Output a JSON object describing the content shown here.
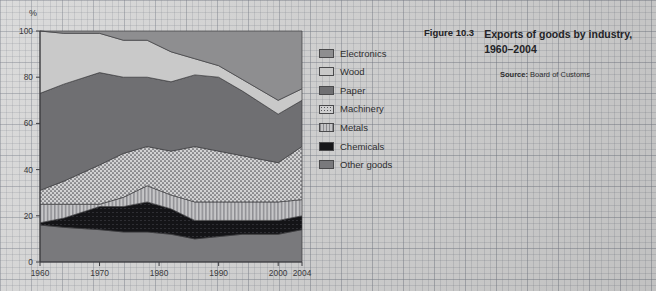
{
  "caption": {
    "figure_number": "Figure 10.3",
    "title_line1": "Exports of goods by industry,",
    "title_line2": "1960–2004",
    "source_label": "Source:",
    "source_value": "Board of Customs"
  },
  "legend": {
    "items": [
      {
        "label": "Electronics",
        "swatch": "electronics",
        "color": "#8e8e90"
      },
      {
        "label": "Wood",
        "swatch": "wood",
        "color": "#c9c9c9"
      },
      {
        "label": "Paper",
        "swatch": "paper",
        "color": "#6f6f72"
      },
      {
        "label": "Machinery",
        "swatch": "machinery",
        "color": "#cfcfd0"
      },
      {
        "label": "Metals",
        "swatch": "metals",
        "color": "#c4c4c6"
      },
      {
        "label": "Chemicals",
        "swatch": "chemicals",
        "color": "#17171a"
      },
      {
        "label": "Other goods",
        "swatch": "other",
        "color": "#79797c"
      }
    ]
  },
  "chart_data": {
    "type": "area",
    "title": "Exports of goods by industry, 1960–2004",
    "xlabel": "",
    "ylabel": "%",
    "unit_label": "%",
    "stacked": true,
    "grid": false,
    "legend_position": "right",
    "xlim": [
      1960,
      2004
    ],
    "ylim": [
      0,
      100
    ],
    "ytick_labels": [
      "0",
      "20",
      "40",
      "60",
      "80",
      "100"
    ],
    "yticks": [
      0,
      20,
      40,
      60,
      80,
      100
    ],
    "xtick_labels": [
      "1960",
      "1970",
      "1980",
      "1990",
      "2000",
      "2004"
    ],
    "xticks": [
      1960,
      1970,
      1980,
      1990,
      2000,
      2004
    ],
    "x": [
      1960,
      1964,
      1970,
      1974,
      1978,
      1982,
      1986,
      1990,
      1994,
      2000,
      2004
    ],
    "series": [
      {
        "name": "Other goods",
        "values": [
          16,
          15,
          14,
          13,
          13,
          12,
          10,
          11,
          12,
          12,
          14
        ]
      },
      {
        "name": "Chemicals",
        "values": [
          1,
          4,
          10,
          11,
          13,
          11,
          8,
          7,
          6,
          6,
          6
        ]
      },
      {
        "name": "Metals",
        "values": [
          8,
          6,
          1,
          4,
          7,
          6,
          8,
          8,
          8,
          8,
          7
        ]
      },
      {
        "name": "Machinery",
        "values": [
          6,
          10,
          17,
          19,
          17,
          19,
          24,
          22,
          20,
          17,
          23
        ]
      },
      {
        "name": "Paper",
        "values": [
          42,
          42,
          40,
          33,
          30,
          30,
          31,
          32,
          28,
          21,
          20
        ]
      },
      {
        "name": "Wood",
        "values": [
          27,
          22,
          17,
          16,
          16,
          13,
          7,
          5,
          5,
          6,
          5
        ]
      },
      {
        "name": "Electronics",
        "values": [
          0,
          1,
          1,
          4,
          4,
          9,
          12,
          15,
          21,
          30,
          25
        ]
      }
    ],
    "cumulative_tops": {
      "Other goods": [
        16,
        15,
        14,
        13,
        13,
        12,
        10,
        11,
        12,
        12,
        14
      ],
      "Chemicals": [
        17,
        19,
        24,
        24,
        26,
        23,
        18,
        18,
        18,
        18,
        20
      ],
      "Metals": [
        25,
        25,
        25,
        28,
        33,
        29,
        26,
        26,
        26,
        26,
        27
      ],
      "Machinery": [
        31,
        35,
        42,
        47,
        50,
        48,
        50,
        48,
        46,
        43,
        50
      ],
      "Paper": [
        73,
        77,
        82,
        80,
        80,
        78,
        81,
        80,
        74,
        64,
        70
      ],
      "Wood": [
        100,
        99,
        99,
        96,
        96,
        91,
        88,
        85,
        79,
        70,
        75
      ],
      "Electronics": [
        100,
        100,
        100,
        100,
        100,
        100,
        100,
        100,
        100,
        100,
        100
      ]
    }
  }
}
